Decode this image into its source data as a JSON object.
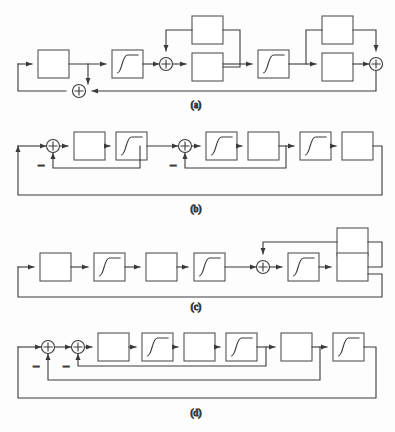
{
  "figure": {
    "type": "block-diagram-set",
    "background_color": "#fdfdfd",
    "line_color": "#3a3a3a",
    "block_fill": "#ffffff",
    "block_stroke": "#555555",
    "captions": [
      {
        "id": "a",
        "label": "(a)",
        "x": 196,
        "y": 108
      },
      {
        "id": "b",
        "label": "(b)",
        "x": 196,
        "y": 212
      },
      {
        "id": "c",
        "label": "(c)",
        "x": 196,
        "y": 310
      },
      {
        "id": "d",
        "label": "(d)",
        "x": 196,
        "y": 416
      }
    ],
    "symbols": {
      "sum_plus": "+",
      "negative_feedback": "−"
    },
    "panels": [
      {
        "id": "a",
        "caption": "(a)",
        "blocks": [
          {
            "name": "block-a-1",
            "kind": "plain",
            "x": 38,
            "y": 50,
            "w": 31,
            "h": 28
          },
          {
            "name": "block-a-sigmoid-1",
            "kind": "sigmoid",
            "x": 112,
            "y": 50,
            "w": 31,
            "h": 28
          },
          {
            "name": "block-a-upper-1",
            "kind": "plain",
            "x": 192,
            "y": 16,
            "w": 31,
            "h": 28
          },
          {
            "name": "block-a-lower-1",
            "kind": "plain",
            "x": 192,
            "y": 53,
            "w": 31,
            "h": 28
          },
          {
            "name": "block-a-sigmoid-2",
            "kind": "sigmoid",
            "x": 258,
            "y": 50,
            "w": 31,
            "h": 28
          },
          {
            "name": "block-a-upper-2",
            "kind": "plain",
            "x": 322,
            "y": 16,
            "w": 31,
            "h": 28
          },
          {
            "name": "block-a-lower-2",
            "kind": "plain",
            "x": 322,
            "y": 53,
            "w": 31,
            "h": 28
          }
        ],
        "sums": [
          {
            "name": "sum-a-1",
            "cx": 79,
            "cy": 91,
            "sign": "+"
          },
          {
            "name": "sum-a-2",
            "cx": 166,
            "cy": 64,
            "sign": "+"
          },
          {
            "name": "sum-a-3",
            "cx": 376,
            "cy": 64,
            "sign": "+"
          }
        ]
      },
      {
        "id": "b",
        "caption": "(b)",
        "blocks": [
          {
            "name": "block-b-1",
            "kind": "plain",
            "x": 74,
            "y": 132,
            "w": 31,
            "h": 28
          },
          {
            "name": "block-b-sigmoid-1",
            "kind": "sigmoid",
            "x": 116,
            "y": 132,
            "w": 31,
            "h": 28
          },
          {
            "name": "block-b-sigmoid-2",
            "kind": "sigmoid",
            "x": 206,
            "y": 132,
            "w": 31,
            "h": 28
          },
          {
            "name": "block-b-2",
            "kind": "plain",
            "x": 248,
            "y": 132,
            "w": 31,
            "h": 28
          },
          {
            "name": "block-b-sigmoid-3",
            "kind": "sigmoid",
            "x": 300,
            "y": 132,
            "w": 31,
            "h": 28
          },
          {
            "name": "block-b-3",
            "kind": "plain",
            "x": 342,
            "y": 132,
            "w": 31,
            "h": 28
          }
        ],
        "sums": [
          {
            "name": "sum-b-1",
            "cx": 53,
            "cy": 146,
            "sign": "+"
          },
          {
            "name": "sum-b-2",
            "cx": 185,
            "cy": 146,
            "sign": "+"
          }
        ],
        "minus_labels": [
          {
            "name": "minus-b-1",
            "x": 41,
            "y": 170
          },
          {
            "name": "minus-b-2",
            "x": 173,
            "y": 170
          }
        ]
      },
      {
        "id": "c",
        "caption": "(c)",
        "blocks": [
          {
            "name": "block-c-1",
            "kind": "plain",
            "x": 40,
            "y": 253,
            "w": 31,
            "h": 28
          },
          {
            "name": "block-c-sigmoid-1",
            "kind": "sigmoid",
            "x": 94,
            "y": 253,
            "w": 31,
            "h": 28
          },
          {
            "name": "block-c-2",
            "kind": "plain",
            "x": 146,
            "y": 253,
            "w": 31,
            "h": 28
          },
          {
            "name": "block-c-sigmoid-2",
            "kind": "sigmoid",
            "x": 194,
            "y": 253,
            "w": 31,
            "h": 28
          },
          {
            "name": "block-c-sigmoid-3",
            "kind": "sigmoid",
            "x": 288,
            "y": 253,
            "w": 31,
            "h": 28
          },
          {
            "name": "block-c-upper",
            "kind": "plain",
            "x": 337,
            "y": 228,
            "w": 31,
            "h": 28
          },
          {
            "name": "block-c-lower",
            "kind": "plain",
            "x": 337,
            "y": 253,
            "w": 31,
            "h": 28
          }
        ],
        "sums": [
          {
            "name": "sum-c-1",
            "cx": 263,
            "cy": 267,
            "sign": "+"
          }
        ]
      },
      {
        "id": "d",
        "caption": "(d)",
        "blocks": [
          {
            "name": "block-d-1",
            "kind": "plain",
            "x": 98,
            "y": 333,
            "w": 31,
            "h": 28
          },
          {
            "name": "block-d-sigmoid-1",
            "kind": "sigmoid",
            "x": 142,
            "y": 333,
            "w": 31,
            "h": 28
          },
          {
            "name": "block-d-2",
            "kind": "plain",
            "x": 184,
            "y": 333,
            "w": 31,
            "h": 28
          },
          {
            "name": "block-d-sigmoid-2",
            "kind": "sigmoid",
            "x": 226,
            "y": 333,
            "w": 31,
            "h": 28
          },
          {
            "name": "block-d-3",
            "kind": "plain",
            "x": 281,
            "y": 333,
            "w": 31,
            "h": 28
          },
          {
            "name": "block-d-sigmoid-3",
            "kind": "sigmoid",
            "x": 333,
            "y": 333,
            "w": 31,
            "h": 28
          }
        ],
        "sums": [
          {
            "name": "sum-d-1",
            "cx": 48,
            "cy": 347,
            "sign": "+"
          },
          {
            "name": "sum-d-2",
            "cx": 78,
            "cy": 347,
            "sign": "+"
          }
        ],
        "minus_labels": [
          {
            "name": "minus-d-1",
            "x": 36,
            "y": 371
          },
          {
            "name": "minus-d-2",
            "x": 66,
            "y": 371
          }
        ]
      }
    ]
  }
}
